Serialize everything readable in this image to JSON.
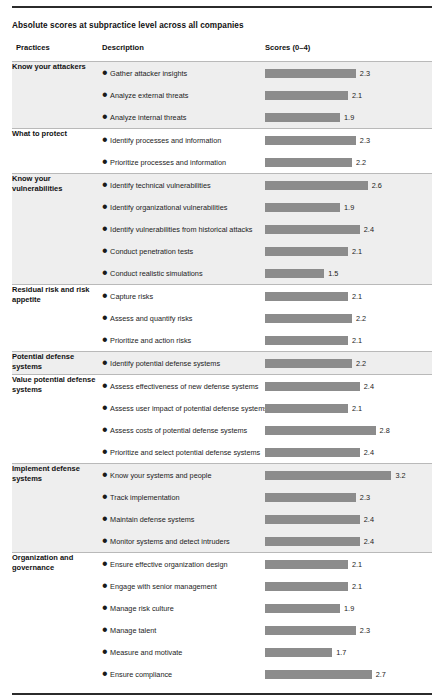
{
  "exhibit": {
    "title": "Absolute scores at subpractice level across all companies",
    "bar_color": "#8c8c8c",
    "shade_color": "#eeeeee",
    "rule_color": "#2b2b2b"
  },
  "columns": {
    "practices": "Practices",
    "description": "Description",
    "scores": "Scores (0–4)"
  },
  "chart_data": {
    "type": "bar",
    "title": "Absolute scores at subpractice level across all companies",
    "xlabel": "Scores (0–4)",
    "ylabel": "",
    "xlim": [
      0,
      4
    ],
    "grid": false,
    "legend": "none",
    "orientation": "horizontal",
    "categories": [
      "Gather attacker insights",
      "Analyze external threats",
      "Analyze internal threats",
      "Identify processes and information",
      "Prioritize processes and information",
      "Identify technical vulnerabilities",
      "Identify organizational vulnerabilities",
      "Identify vulnerabilities from historical attacks",
      "Conduct penetration tests",
      "Conduct realistic simulations",
      "Capture risks",
      "Assess and quantify risks",
      "Prioritize and action risks",
      "Identify potential defense systems",
      "Assess effectiveness of new defense systems",
      "Assess user impact of potential defense systems",
      "Assess costs of potential defense systems",
      "Prioritize and select potential defense systems",
      "Know your systems and people",
      "Track implementation",
      "Maintain defense systems",
      "Monitor systems and detect intruders",
      "Ensure effective organization design",
      "Engage with senior management",
      "Manage risk culture",
      "Manage talent",
      "Measure and motivate",
      "Ensure compliance"
    ],
    "values": [
      2.3,
      2.1,
      1.9,
      2.3,
      2.2,
      2.6,
      1.9,
      2.4,
      2.1,
      1.5,
      2.1,
      2.2,
      2.1,
      2.2,
      2.4,
      2.1,
      2.8,
      2.4,
      3.2,
      2.3,
      2.4,
      2.4,
      2.1,
      2.1,
      1.9,
      2.3,
      1.7,
      2.7
    ]
  },
  "groups": [
    {
      "practice": "Know your attackers",
      "shaded": true,
      "rows": [
        {
          "description": "Gather attacker insights",
          "score": 2.3,
          "score_label": "2.3"
        },
        {
          "description": "Analyze external threats",
          "score": 2.1,
          "score_label": "2.1"
        },
        {
          "description": "Analyze internal threats",
          "score": 1.9,
          "score_label": "1.9"
        }
      ]
    },
    {
      "practice": "What to protect",
      "shaded": false,
      "rows": [
        {
          "description": "Identify processes and information",
          "score": 2.3,
          "score_label": "2.3"
        },
        {
          "description": "Prioritize processes and information",
          "score": 2.2,
          "score_label": "2.2"
        }
      ]
    },
    {
      "practice": "Know your vulnerabilities",
      "shaded": true,
      "rows": [
        {
          "description": "Identify technical vulnerabilities",
          "score": 2.6,
          "score_label": "2.6"
        },
        {
          "description": "Identify organizational vulnerabilities",
          "score": 1.9,
          "score_label": "1.9"
        },
        {
          "description": "Identify vulnerabilities from historical attacks",
          "score": 2.4,
          "score_label": "2.4"
        },
        {
          "description": "Conduct penetration tests",
          "score": 2.1,
          "score_label": "2.1"
        },
        {
          "description": "Conduct realistic simulations",
          "score": 1.5,
          "score_label": "1.5"
        }
      ]
    },
    {
      "practice": "Residual risk and risk appetite",
      "shaded": false,
      "rows": [
        {
          "description": "Capture risks",
          "score": 2.1,
          "score_label": "2.1"
        },
        {
          "description": "Assess and quantify risks",
          "score": 2.2,
          "score_label": "2.2"
        },
        {
          "description": "Prioritize and action risks",
          "score": 2.1,
          "score_label": "2.1"
        }
      ]
    },
    {
      "practice": "Potential defense systems",
      "shaded": true,
      "rows": [
        {
          "description": "Identify potential defense systems",
          "score": 2.2,
          "score_label": "2.2"
        }
      ]
    },
    {
      "practice": "Value potential defense systems",
      "shaded": false,
      "rows": [
        {
          "description": "Assess effectiveness of new defense systems",
          "score": 2.4,
          "score_label": "2.4"
        },
        {
          "description": "Assess user impact of potential defense systems",
          "score": 2.1,
          "score_label": "2.1"
        },
        {
          "description": "Assess costs of potential defense systems",
          "score": 2.8,
          "score_label": "2.8"
        },
        {
          "description": "Prioritize and select potential defense systems",
          "score": 2.4,
          "score_label": "2.4"
        }
      ]
    },
    {
      "practice": "Implement defense systems",
      "shaded": true,
      "rows": [
        {
          "description": "Know your systems and people",
          "score": 3.2,
          "score_label": "3.2"
        },
        {
          "description": "Track implementation",
          "score": 2.3,
          "score_label": "2.3"
        },
        {
          "description": "Maintain defense systems",
          "score": 2.4,
          "score_label": "2.4"
        },
        {
          "description": "Monitor systems and detect intruders",
          "score": 2.4,
          "score_label": "2.4"
        }
      ]
    },
    {
      "practice": "Organization and governance",
      "shaded": false,
      "rows": [
        {
          "description": "Ensure effective organization design",
          "score": 2.1,
          "score_label": "2.1"
        },
        {
          "description": "Engage with senior management",
          "score": 2.1,
          "score_label": "2.1"
        },
        {
          "description": "Manage risk culture",
          "score": 1.9,
          "score_label": "1.9"
        },
        {
          "description": "Manage talent",
          "score": 2.3,
          "score_label": "2.3"
        },
        {
          "description": "Measure and motivate",
          "score": 1.7,
          "score_label": "1.7"
        },
        {
          "description": "Ensure compliance",
          "score": 2.7,
          "score_label": "2.7"
        }
      ]
    }
  ]
}
